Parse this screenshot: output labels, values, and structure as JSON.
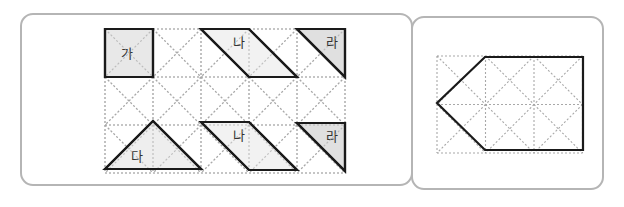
{
  "left_panel": {
    "grid": {
      "x0": 105,
      "y0": 29,
      "cols": 5,
      "rows": 3,
      "cell": 48
    },
    "pieces": [
      {
        "id": "ga",
        "label": "가",
        "fill": "#e4e4e4",
        "points": [
          [
            105,
            29
          ],
          [
            153,
            29
          ],
          [
            153,
            77
          ],
          [
            105,
            77
          ]
        ],
        "label_pos": [
          121,
          58
        ]
      },
      {
        "id": "na-top",
        "label": "나",
        "fill": "#f0f0f0",
        "points": [
          [
            201,
            29
          ],
          [
            249,
            29
          ],
          [
            297,
            77
          ],
          [
            249,
            77
          ]
        ],
        "label_pos": [
          233,
          47
        ]
      },
      {
        "id": "ra-top",
        "label": "라",
        "fill": "#dadada",
        "points": [
          [
            297,
            29
          ],
          [
            345,
            29
          ],
          [
            345,
            77
          ]
        ],
        "label_pos": [
          326,
          47
        ]
      },
      {
        "id": "da",
        "label": "다",
        "fill": "#ebebeb",
        "points": [
          [
            105,
            169
          ],
          [
            153,
            121
          ],
          [
            201,
            169
          ]
        ],
        "label_pos": [
          131,
          161
        ]
      },
      {
        "id": "na-bottom",
        "label": "나",
        "fill": "#f0f0f0",
        "points": [
          [
            201,
            122
          ],
          [
            249,
            122
          ],
          [
            297,
            170
          ],
          [
            249,
            170
          ]
        ],
        "label_pos": [
          233,
          140
        ]
      },
      {
        "id": "ra-bottom",
        "label": "라",
        "fill": "#dadada",
        "points": [
          [
            297,
            123
          ],
          [
            345,
            123
          ],
          [
            345,
            171
          ]
        ],
        "label_pos": [
          326,
          141
        ]
      }
    ]
  },
  "right_panel": {
    "grid": {
      "x0": 437,
      "y0": 56,
      "cols": 3,
      "rows": 2,
      "cell": 48.5
    },
    "outline": {
      "id": "target-shape",
      "points": [
        [
          485,
          57
        ],
        [
          583,
          57
        ],
        [
          583,
          150
        ],
        [
          485,
          150
        ],
        [
          437,
          103
        ]
      ]
    }
  }
}
